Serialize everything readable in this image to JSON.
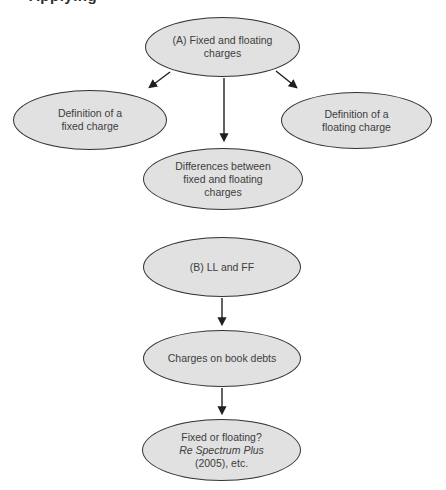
{
  "page": {
    "background_color": "#ffffff",
    "cropped_header_text": "Applying"
  },
  "diagram": {
    "colors": {
      "node_fill": "#e1e1e1",
      "node_border": "#333333",
      "arrow": "#1f1f1f",
      "text": "#3d3d3d"
    },
    "nodes": {
      "a": {
        "line1": "(A) Fixed and floating",
        "line2": "charges"
      },
      "def_fixed": {
        "line1": "Definition of a",
        "line2": "fixed charge"
      },
      "def_floating": {
        "line1": "Definition of a",
        "line2": "floating charge"
      },
      "differences": {
        "line1": "Differences between",
        "line2": "fixed and floating",
        "line3": "charges"
      },
      "b": {
        "line1": "(B) LL and FF"
      },
      "book_debts": {
        "line1": "Charges on book debts"
      },
      "spectrum": {
        "line1": "Fixed or floating?",
        "line2": "Re Spectrum Plus",
        "line3": "(2005), etc."
      }
    }
  }
}
